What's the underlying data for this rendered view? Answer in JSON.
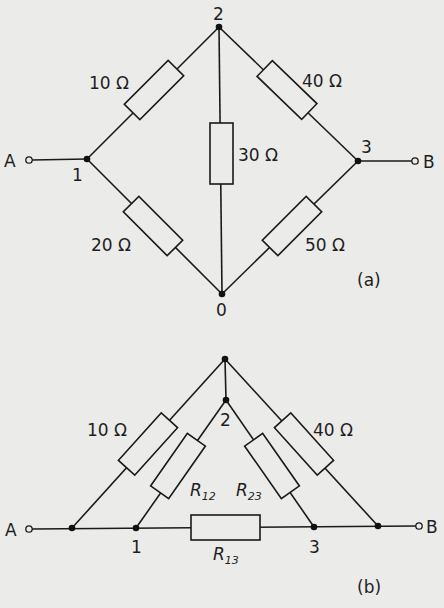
{
  "diagram_a": {
    "caption": "(a)",
    "terminals": {
      "left": "A",
      "right": "B"
    },
    "nodes": {
      "n0": "0",
      "n1": "1",
      "n2": "2",
      "n3": "3"
    },
    "resistors": {
      "r12": "10 Ω",
      "r23": "40 Ω",
      "r20": "30 Ω",
      "r10": "20 Ω",
      "r30": "50 Ω"
    }
  },
  "diagram_b": {
    "caption": "(b)",
    "terminals": {
      "left": "A",
      "right": "B"
    },
    "nodes": {
      "n2": "2",
      "n1": "1",
      "n3": "3"
    },
    "resistors": {
      "left": "10 Ω",
      "right": "40 Ω",
      "r12_main": "R",
      "r12_sub": "12",
      "r23_main": "R",
      "r23_sub": "23",
      "r13_main": "R",
      "r13_sub": "13"
    }
  }
}
